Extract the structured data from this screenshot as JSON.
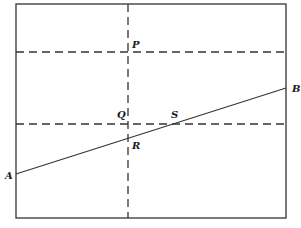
{
  "diagram": {
    "type": "geometry",
    "colors": {
      "stroke": "#333333",
      "background": "#ffffff"
    },
    "frame": {
      "x1": 16,
      "y1": 4,
      "x2": 286,
      "y2": 218
    },
    "dashed_lines": [
      {
        "id": "vertical",
        "x1": 128,
        "y1": 4,
        "x2": 128,
        "y2": 218
      },
      {
        "id": "horizontal-upper",
        "x1": 16,
        "y1": 52,
        "x2": 286,
        "y2": 52
      },
      {
        "id": "horizontal-lower",
        "x1": 16,
        "y1": 124,
        "x2": 286,
        "y2": 124
      }
    ],
    "segment_AB": {
      "x1": 16,
      "y1": 174,
      "x2": 286,
      "y2": 88
    },
    "points": {
      "A": {
        "label": "A",
        "x": 5,
        "y": 179
      },
      "B": {
        "label": "B",
        "x": 292,
        "y": 92
      },
      "P": {
        "label": "P",
        "x": 132,
        "y": 48
      },
      "Q": {
        "label": "Q",
        "x": 117,
        "y": 118
      },
      "R": {
        "label": "R",
        "x": 132,
        "y": 149
      },
      "S": {
        "label": "S",
        "x": 171,
        "y": 118
      }
    }
  }
}
